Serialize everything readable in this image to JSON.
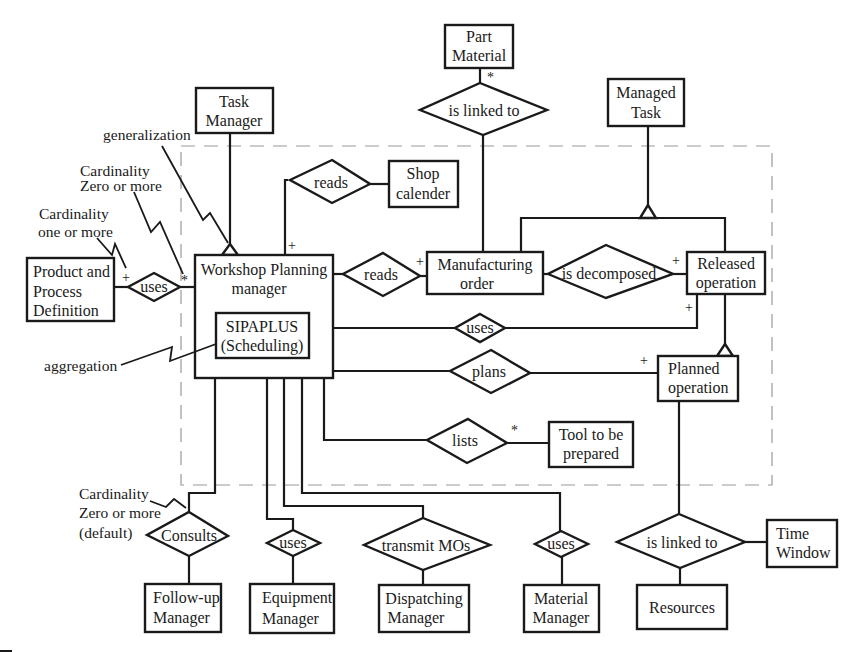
{
  "diagram": {
    "type": "entity-relationship diagram",
    "boundary": "dashed system boundary",
    "entities": {
      "part_material": [
        "Part",
        "Material"
      ],
      "task_manager": [
        "Task",
        "Manager"
      ],
      "managed_task": [
        "Managed",
        "Task"
      ],
      "shop_calender": [
        "Shop",
        "calender"
      ],
      "product_process": [
        "Product and",
        "Process",
        "Definition"
      ],
      "workshop_planning": [
        "Workshop Planning",
        "manager"
      ],
      "sipaplus": [
        "SIPAPLUS",
        "(Scheduling)"
      ],
      "manufacturing_order": [
        "Manufacturing",
        "order"
      ],
      "released_operation": [
        "Released",
        "operation"
      ],
      "planned_operation": [
        "Planned",
        "operation"
      ],
      "tool_prepared": [
        "Tool to be",
        "prepared"
      ],
      "followup_manager": [
        "Follow-up",
        "Manager"
      ],
      "equipment_manager": [
        "Equipment",
        "Manager"
      ],
      "dispatching_manager": [
        "Dispatching",
        "Manager"
      ],
      "material_manager": [
        "Material",
        "Manager"
      ],
      "resources": [
        "Resources"
      ],
      "time_window": [
        "Time",
        "Window"
      ]
    },
    "relationships": {
      "is_linked_to_top": "is linked to",
      "reads_calendar": "reads",
      "reads_order": "reads",
      "uses_product": "uses",
      "is_decomposed": "is decomposed",
      "uses_released": "uses",
      "plans": "plans",
      "lists": "lists",
      "consults": "Consults",
      "uses_equipment": "uses",
      "transmit_mos": "transmit MOs",
      "uses_material": "uses",
      "is_linked_to_bottom": "is linked to"
    },
    "annotations": {
      "generalization": "generalization",
      "card_zero_more": [
        "Cardinality",
        "Zero or more"
      ],
      "card_one_more": [
        "Cardinality",
        "one or more"
      ],
      "aggregation": "aggregation",
      "card_default": [
        "Cardinality",
        "Zero or more",
        "(default)"
      ]
    },
    "cardinality_marks": {
      "plus": "+",
      "star": "*"
    }
  }
}
